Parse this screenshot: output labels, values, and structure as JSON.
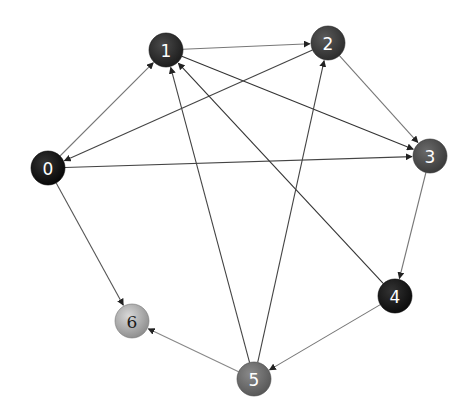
{
  "diagram": {
    "type": "directed-graph",
    "nodes": [
      {
        "id": "0",
        "label": "0",
        "x": 48,
        "y": 168,
        "fill": "#111111"
      },
      {
        "id": "1",
        "label": "1",
        "x": 166,
        "y": 50,
        "fill": "#2a2a2a"
      },
      {
        "id": "2",
        "label": "2",
        "x": 328,
        "y": 43,
        "fill": "#3a3a3a"
      },
      {
        "id": "3",
        "label": "3",
        "x": 430,
        "y": 156,
        "fill": "#474747"
      },
      {
        "id": "4",
        "label": "4",
        "x": 395,
        "y": 296,
        "fill": "#161616"
      },
      {
        "id": "5",
        "label": "5",
        "x": 254,
        "y": 379,
        "fill": "#6a6a6a"
      },
      {
        "id": "6",
        "label": "6",
        "x": 132,
        "y": 321,
        "fill": "#a8a8a8",
        "text_color": "#1a1a1a"
      }
    ],
    "edges": [
      {
        "from": "0",
        "to": "1",
        "color": "#777777"
      },
      {
        "from": "1",
        "to": "2",
        "color": "#777777"
      },
      {
        "from": "1",
        "to": "3",
        "color": "#333333"
      },
      {
        "from": "2",
        "to": "0",
        "color": "#444444"
      },
      {
        "from": "2",
        "to": "3",
        "color": "#777777"
      },
      {
        "from": "0",
        "to": "3",
        "color": "#444444"
      },
      {
        "from": "0",
        "to": "6",
        "color": "#555555"
      },
      {
        "from": "3",
        "to": "4",
        "color": "#777777"
      },
      {
        "from": "4",
        "to": "1",
        "color": "#333333"
      },
      {
        "from": "4",
        "to": "5",
        "color": "#777777"
      },
      {
        "from": "5",
        "to": "1",
        "color": "#444444"
      },
      {
        "from": "5",
        "to": "2",
        "color": "#444444"
      },
      {
        "from": "5",
        "to": "6",
        "color": "#888888"
      }
    ],
    "node_radius": 17
  },
  "labels": {
    "n0": "0",
    "n1": "1",
    "n2": "2",
    "n3": "3",
    "n4": "4",
    "n5": "5",
    "n6": "6"
  }
}
